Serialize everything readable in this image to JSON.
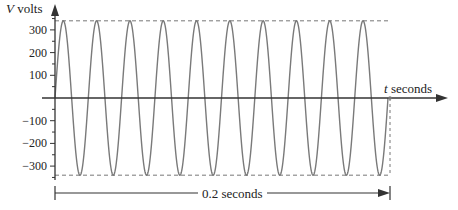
{
  "chart_data": {
    "type": "line",
    "title": "",
    "xlabel": "t seconds",
    "ylabel": "V volts",
    "y_ticks": [
      300,
      200,
      100,
      -100,
      -200,
      -300
    ],
    "y_tick_labels": [
      "300",
      "200",
      "100",
      "−100",
      "−200",
      "−300"
    ],
    "ylim": [
      -380,
      380
    ],
    "amplitude": 340,
    "cycles": 10,
    "duration_label": "0.2 seconds",
    "duration_seconds": 0.2,
    "frequency_hz": 50,
    "series": [
      {
        "name": "V(t) = 340 sin(2π·50t)",
        "function": "sine",
        "amplitude": 340,
        "frequency": 50,
        "t_range": [
          0,
          0.2
        ]
      }
    ],
    "reference_lines": [
      {
        "type": "dashed",
        "y": 340
      },
      {
        "type": "dashed",
        "y": -340
      }
    ],
    "colors": {
      "curve": "#7a7a7a",
      "axes": "#333333",
      "dashed": "#777777"
    }
  },
  "labels": {
    "y_axis": "V volts",
    "y_axis_var": "V",
    "y_axis_unit": "volts",
    "x_axis_var": "t",
    "x_axis_unit": "seconds",
    "duration": "0.2 seconds"
  }
}
